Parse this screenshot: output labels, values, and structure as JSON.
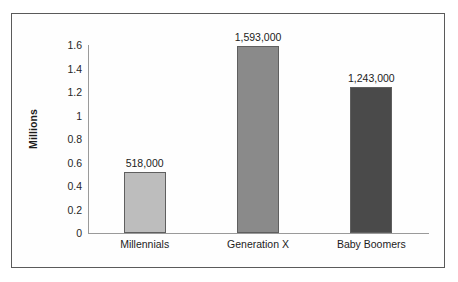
{
  "chart_data": {
    "type": "bar",
    "title": "",
    "xlabel": "",
    "ylabel": "Millions",
    "ylim": [
      0,
      1.6
    ],
    "grid": false,
    "legend": "none",
    "categories": [
      "Millennials",
      "Generation X",
      "Baby Boomers"
    ],
    "values": [
      0.518,
      1.593,
      1.243
    ],
    "data_labels": [
      "518,000",
      "1,593,000",
      "1,243,000"
    ],
    "ytick_labels": [
      "1.6",
      "1.4",
      "1.2",
      "1",
      "0.8",
      "0.6",
      "0.4",
      "0.2",
      "0"
    ],
    "ytick_values": [
      1.6,
      1.4,
      1.2,
      1.0,
      0.8,
      0.6,
      0.4,
      0.2,
      0
    ],
    "bar_colors": [
      "#bdbdbd",
      "#8a8a8a",
      "#4a4a4a"
    ],
    "bar_border_color": "#5f5f5f",
    "axis_color": "#9a9a9a",
    "text_color": "#1c1c1c",
    "frame_color": "#5a5a5a",
    "background_color": "#ffffff"
  }
}
